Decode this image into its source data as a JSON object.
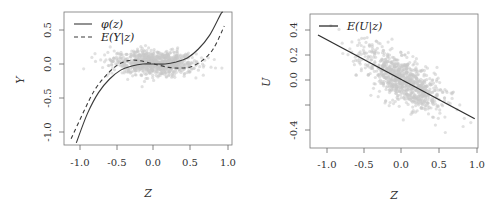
{
  "chart_data": [
    {
      "type": "scatter",
      "panel": "left",
      "title": "",
      "xlabel": "Z",
      "ylabel": "Y",
      "xlim": [
        -1.15,
        1.0
      ],
      "ylim": [
        -1.2,
        0.75
      ],
      "xticks": [
        "-1.0",
        "-0.5",
        "0.0",
        "0.5",
        "1.0"
      ],
      "yticks": [
        "-1.0",
        "-0.5",
        "0.0",
        "0.5"
      ],
      "grid": false,
      "legend_position": "top-left",
      "series": [
        {
          "name": "φ(z)",
          "type": "line",
          "style": "solid",
          "color": "#444444",
          "x": [
            -1.05,
            -0.9,
            -0.75,
            -0.6,
            -0.45,
            -0.3,
            -0.15,
            0.0,
            0.15,
            0.3,
            0.45,
            0.6,
            0.75,
            0.9,
            0.93
          ],
          "y": [
            -1.16,
            -0.73,
            -0.42,
            -0.22,
            -0.09,
            -0.03,
            0.0,
            0.0,
            0.0,
            0.03,
            0.09,
            0.22,
            0.42,
            0.73,
            0.76
          ]
        },
        {
          "name": "E(Y|z)",
          "type": "line",
          "style": "dashed",
          "color": "#444444",
          "x": [
            -1.12,
            -0.95,
            -0.8,
            -0.65,
            -0.5,
            -0.35,
            -0.2,
            0.0,
            0.2,
            0.35,
            0.5,
            0.65,
            0.8,
            0.95
          ],
          "y": [
            -1.1,
            -0.7,
            -0.38,
            -0.17,
            -0.02,
            0.05,
            0.05,
            0.0,
            -0.05,
            -0.06,
            -0.04,
            0.05,
            0.22,
            0.56
          ]
        },
        {
          "name": "observations",
          "type": "scatter",
          "color": "#c8c8c8",
          "description": "~1000 light grey points, Z mostly in [-0.7, 0.7], Y mostly in [-0.25, 0.25]"
        }
      ]
    },
    {
      "type": "scatter",
      "panel": "right",
      "title": "",
      "xlabel": "Z",
      "ylabel": "U",
      "xlim": [
        -1.15,
        1.0
      ],
      "ylim": [
        -0.55,
        0.5
      ],
      "xticks": [
        "-1.0",
        "-0.5",
        "0.0",
        "0.5",
        "1.0"
      ],
      "yticks": [
        "-0.4",
        "0.0",
        "0.2",
        "0.4"
      ],
      "ytick_positions": [
        -0.4,
        -0.2,
        0.0,
        0.2,
        0.4
      ],
      "grid": false,
      "legend_position": "top-left",
      "series": [
        {
          "name": "E(U|z)",
          "type": "line",
          "style": "solid",
          "color": "#333333",
          "x": [
            -1.12,
            0.97
          ],
          "y": [
            0.36,
            -0.31
          ]
        },
        {
          "name": "observations",
          "type": "scatter",
          "color": "#c8c8c8",
          "description": "~1000 light grey points in a negatively-correlated ellipse around the line, Z mostly in [-0.7, 0.8], U in [-0.45, 0.45]"
        }
      ]
    }
  ],
  "left": {
    "xlabel": "Z",
    "ylabel": "Y",
    "xticks": [
      "-1.0",
      "-0.5",
      "0.0",
      "0.5",
      "1.0"
    ],
    "yticks": [
      "0.5",
      "0.0",
      "-0.5",
      "-1.0"
    ],
    "legend": [
      "φ(z)",
      "E(Y|z)"
    ]
  },
  "right": {
    "xlabel": "Z",
    "ylabel": "U",
    "xticks": [
      "-1.0",
      "-0.5",
      "0.0",
      "0.5",
      "1.0"
    ],
    "yticks": [
      "0.4",
      "0.2",
      "0.0",
      "-0.4"
    ],
    "legend": [
      "E(U|z)"
    ]
  },
  "colors": {
    "points": "#c8c8c8",
    "line": "#3a3a3a",
    "axis": "#555555"
  }
}
